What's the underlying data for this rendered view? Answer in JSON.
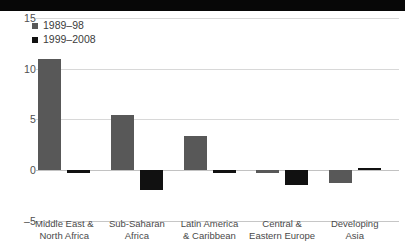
{
  "chart_data": {
    "type": "bar",
    "title": "",
    "subtitle": "",
    "xlabel": "",
    "ylabel": "",
    "categories": [
      "Middle East & North Africa",
      "Sub-Saharan Africa",
      "Latin America & Caribbean",
      "Central & Eastern Europe",
      "Developing Asia"
    ],
    "category_lines": [
      [
        "Middle East &",
        "North Africa"
      ],
      [
        "Sub-Saharan",
        "Africa"
      ],
      [
        "Latin America",
        "& Caribbean"
      ],
      [
        "Central &",
        "Eastern Europe"
      ],
      [
        "Developing",
        "Asia"
      ]
    ],
    "series": [
      {
        "name": "1989–98",
        "color": "#585858",
        "values": [
          11.0,
          5.4,
          3.4,
          -0.1,
          -1.3
        ]
      },
      {
        "name": "1999–2008",
        "color": "#111111",
        "values": [
          -0.3,
          -2.0,
          -0.3,
          -1.5,
          0.1
        ]
      }
    ],
    "ylim": [
      -5,
      15
    ],
    "yticks": [
      15,
      10,
      5,
      0,
      -5
    ],
    "ytick_labels": [
      "15",
      "10",
      "5",
      "0",
      "–5"
    ],
    "grid": true,
    "legend_position": "top-left"
  },
  "colors": {
    "series_1989_98": "#585858",
    "series_1999_2008": "#111111",
    "gridline": "#d8d8d8",
    "zero_line": "#c2c2c2",
    "axis_text": "#4f4f4f",
    "background": "#ffffff"
  }
}
